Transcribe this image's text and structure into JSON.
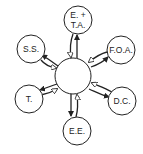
{
  "diagram": {
    "type": "hub-and-spoke",
    "center": {
      "label": "",
      "cx": 73,
      "cy": 76,
      "r": 18
    },
    "nodes": [
      {
        "id": "et",
        "line1": "E. +",
        "line2": "T.A.",
        "cx": 78,
        "cy": 20,
        "r": 14
      },
      {
        "id": "ss",
        "line1": "S.S.",
        "line2": "",
        "cx": 31,
        "cy": 49,
        "r": 14
      },
      {
        "id": "foa",
        "line1": "F.O.A.",
        "line2": "",
        "cx": 121,
        "cy": 50,
        "r": 14
      },
      {
        "id": "t",
        "line1": "T.",
        "line2": "",
        "cx": 29,
        "cy": 99,
        "r": 14
      },
      {
        "id": "dc",
        "line1": "D.C.",
        "line2": "",
        "cx": 122,
        "cy": 101,
        "r": 14
      },
      {
        "id": "ee",
        "line1": "E.E.",
        "line2": "",
        "cx": 77,
        "cy": 131,
        "r": 14
      }
    ],
    "arrow_style": {
      "outgoing": "solid black arrowhead (center to node)",
      "incoming": "open white arrowhead (node to center)"
    },
    "colors": {
      "stroke": "#222222",
      "fill": "#ffffff"
    }
  }
}
